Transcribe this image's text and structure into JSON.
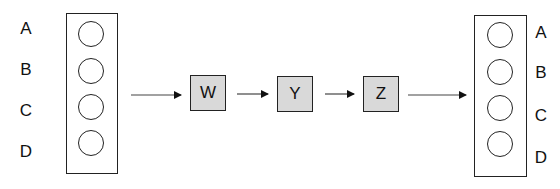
{
  "diagram": {
    "input_layer": {
      "labels": [
        "A",
        "B",
        "C",
        "D"
      ],
      "node_count": 4
    },
    "processing_blocks": [
      {
        "label": "W"
      },
      {
        "label": "Y"
      },
      {
        "label": "Z"
      }
    ],
    "output_layer": {
      "labels": [
        "A",
        "B",
        "C",
        "D"
      ],
      "node_count": 4
    },
    "colors": {
      "block_fill": "#d9d9d9",
      "stroke": "#222222",
      "background": "#ffffff"
    }
  }
}
